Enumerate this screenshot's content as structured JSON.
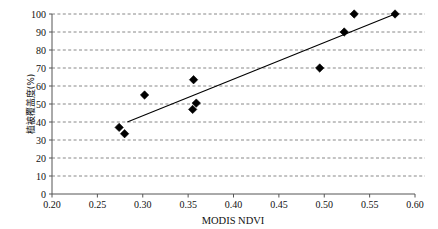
{
  "chart_data": {
    "type": "scatter",
    "title": "",
    "xlabel": "MODIS  NDVI",
    "ylabel": "植被覆盖度(%)",
    "xlim": [
      0.2,
      0.6
    ],
    "ylim": [
      0,
      100
    ],
    "grid": true,
    "grid_axis": "y",
    "legend": "none",
    "xticks": [
      "0.20",
      "0.25",
      "0.30",
      "0.35",
      "0.40",
      "0.45",
      "0.50",
      "0.55",
      "0.60"
    ],
    "xtick_values": [
      0.2,
      0.25,
      0.3,
      0.35,
      0.4,
      0.45,
      0.5,
      0.55,
      0.6
    ],
    "yticks": [
      "0",
      "10",
      "20",
      "30",
      "40",
      "50",
      "60",
      "70",
      "80",
      "90",
      "100"
    ],
    "ytick_values": [
      0,
      10,
      20,
      30,
      40,
      50,
      60,
      70,
      80,
      90,
      100
    ],
    "series": [
      {
        "name": "samples",
        "marker": "diamond",
        "color": "#000000",
        "points": [
          {
            "x": 0.274,
            "y": 37
          },
          {
            "x": 0.28,
            "y": 33.5
          },
          {
            "x": 0.302,
            "y": 55
          },
          {
            "x": 0.355,
            "y": 47
          },
          {
            "x": 0.359,
            "y": 50.5
          },
          {
            "x": 0.356,
            "y": 63.5
          },
          {
            "x": 0.495,
            "y": 70
          },
          {
            "x": 0.522,
            "y": 90
          },
          {
            "x": 0.533,
            "y": 100
          },
          {
            "x": 0.578,
            "y": 100
          }
        ]
      }
    ],
    "trendline": {
      "name": "linear-fit",
      "color": "#000000",
      "x0": 0.283,
      "y0": 40,
      "x1": 0.578,
      "y1": 100
    }
  }
}
